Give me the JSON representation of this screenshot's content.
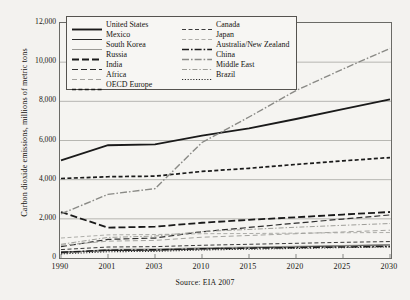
{
  "chart_data": {
    "type": "line",
    "title": "",
    "ylabel": "Carbon dioxide emissions, millions of metric tons",
    "xlabel": "",
    "source": "Source: EIA 2007",
    "grid": true,
    "legend_position": "top-center-inside",
    "ylim": [
      0,
      12000
    ],
    "yticks": [
      "0",
      "2,000",
      "4,000",
      "6,000",
      "8,000",
      "10,000",
      "12,000"
    ],
    "ytick_values": [
      0,
      2000,
      4000,
      6000,
      8000,
      10000,
      12000
    ],
    "xticks": [
      "1990",
      "2001",
      "2003",
      "2010",
      "2015",
      "2020",
      "2025",
      "2030"
    ],
    "xtick_values": [
      1990,
      2001,
      2003,
      2010,
      2015,
      2020,
      2025,
      2030
    ],
    "x": [
      1990,
      2001,
      2003,
      2010,
      2015,
      2020,
      2025,
      2030
    ],
    "series": [
      {
        "name": "United States",
        "color": "#1a1a1a",
        "width": 1.9,
        "dash": "none",
        "values": [
          4990,
          5760,
          5800,
          6250,
          6620,
          7100,
          7600,
          8100
        ]
      },
      {
        "name": "Mexico",
        "color": "#2a2a2a",
        "width": 1.0,
        "dash": "none",
        "values": [
          300,
          380,
          400,
          470,
          520,
          570,
          620,
          670
        ]
      },
      {
        "name": "South Korea",
        "color": "#8e8e8a",
        "width": 0.9,
        "dash": "none",
        "values": [
          240,
          440,
          460,
          520,
          560,
          600,
          640,
          680
        ]
      },
      {
        "name": "Russia",
        "color": "#1a1a1a",
        "width": 1.8,
        "dash": "7,3",
        "values": [
          2350,
          1550,
          1600,
          1800,
          1950,
          2080,
          2220,
          2350
        ]
      },
      {
        "name": "India",
        "color": "#2e2e2e",
        "width": 1.2,
        "dash": "6,3",
        "values": [
          580,
          950,
          1020,
          1340,
          1560,
          1780,
          1990,
          2200
        ]
      },
      {
        "name": "Africa",
        "color": "#9a9a95",
        "width": 0.9,
        "dash": "5,3",
        "values": [
          650,
          860,
          900,
          1060,
          1150,
          1240,
          1330,
          1420
        ]
      },
      {
        "name": "OECD Europe",
        "color": "#1a1a1a",
        "width": 1.7,
        "dash": "4,2.4",
        "values": [
          4060,
          4150,
          4180,
          4420,
          4580,
          4780,
          4960,
          5130
        ]
      },
      {
        "name": "Canada",
        "color": "#3a3a3a",
        "width": 1.0,
        "dash": "4,2.5",
        "values": [
          430,
          560,
          580,
          650,
          700,
          750,
          800,
          840
        ]
      },
      {
        "name": "Japan",
        "color": "#a5a5a0",
        "width": 0.9,
        "dash": "4,2.5",
        "values": [
          1020,
          1180,
          1200,
          1240,
          1250,
          1270,
          1290,
          1300
        ]
      },
      {
        "name": "Australia/New Zealand",
        "color": "#1c1c1c",
        "width": 1.5,
        "dash": "7,2,1.6,2",
        "values": [
          290,
          400,
          420,
          470,
          500,
          530,
          560,
          590
        ]
      },
      {
        "name": "China",
        "color": "#8a8a86",
        "width": 1.4,
        "dash": "7,2,1.6,2",
        "values": [
          2250,
          3250,
          3540,
          5900,
          7200,
          8550,
          9650,
          10700
        ]
      },
      {
        "name": "Middle East",
        "color": "#9e9e99",
        "width": 1.0,
        "dash": "5,2,1.4,2",
        "values": [
          700,
          1050,
          1120,
          1350,
          1460,
          1570,
          1670,
          1760
        ]
      },
      {
        "name": "Brazil",
        "color": "#2b2b2b",
        "width": 1.1,
        "dash": "1.2,1.6",
        "values": [
          210,
          320,
          340,
          410,
          450,
          490,
          530,
          570
        ]
      }
    ]
  }
}
